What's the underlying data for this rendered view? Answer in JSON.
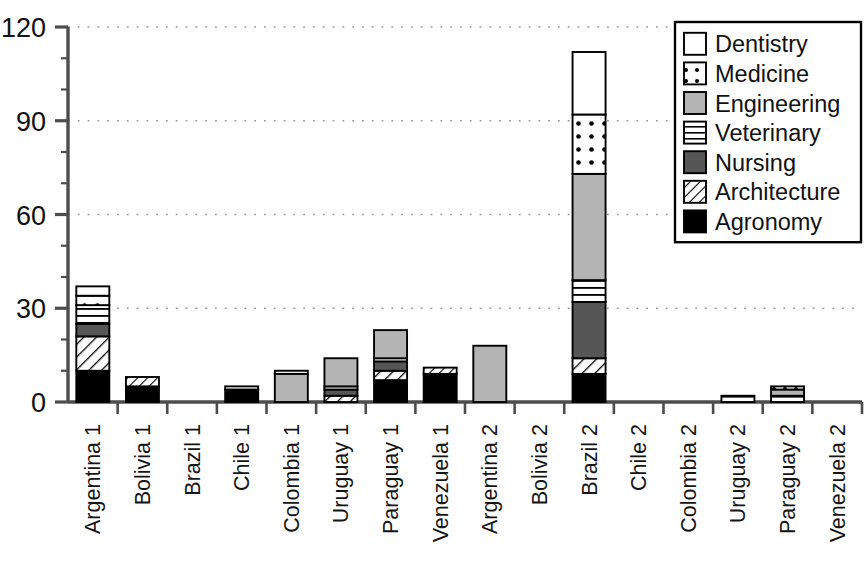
{
  "chart_data": {
    "type": "bar",
    "subtype": "stacked-vertical",
    "title": "",
    "subtitle": "",
    "xlabel": "",
    "ylabel": "",
    "ylim": [
      0,
      120
    ],
    "y_ticks": [
      0,
      30,
      60,
      90,
      120
    ],
    "y_tick_labels": [
      "0",
      "30",
      "60",
      "90",
      "120"
    ],
    "grid": "horizontal-dotted",
    "legend_position": "top-right",
    "categories": [
      "Argentina 1",
      "Bolivia 1",
      "Brazil 1",
      "Chile 1",
      "Colombia 1",
      "Uruguay 1",
      "Paraguay 1",
      "Venezuela 1",
      "Argentina 2",
      "Bolivia 2",
      "Brazil 2",
      "Chile 2",
      "Colombia 2",
      "Uruguay 2",
      "Paraguay 2",
      "Venezuela 2"
    ],
    "series": [
      {
        "name": "Agronomy",
        "pattern": "solid-black",
        "color": "#000000",
        "values": [
          10,
          5,
          0,
          4,
          0,
          0,
          7,
          9,
          0,
          0,
          9,
          0,
          0,
          0,
          0,
          0
        ]
      },
      {
        "name": "Architecture",
        "pattern": "diagonal-hatch",
        "color": "#ffffff",
        "values": [
          11,
          3,
          0,
          0,
          0,
          2,
          3,
          2,
          0,
          0,
          5,
          0,
          0,
          0,
          0,
          0
        ]
      },
      {
        "name": "Nursing",
        "pattern": "solid-dark-gray",
        "color": "#565656",
        "values": [
          4,
          0,
          0,
          0,
          0,
          2,
          3,
          0,
          0,
          0,
          18,
          0,
          0,
          0,
          0,
          0
        ]
      },
      {
        "name": "Veterinary",
        "pattern": "horizontal-lines",
        "color": "#ffffff",
        "values": [
          6,
          0,
          0,
          1,
          0,
          1,
          1,
          0,
          0,
          0,
          7,
          0,
          0,
          2,
          2,
          0
        ]
      },
      {
        "name": "Engineering",
        "pattern": "solid-light-gray",
        "color": "#b4b4b4",
        "values": [
          0,
          0,
          0,
          0,
          9,
          9,
          9,
          0,
          18,
          0,
          34,
          0,
          0,
          0,
          2,
          0
        ]
      },
      {
        "name": "Medicine",
        "pattern": "dotted",
        "color": "#ffffff",
        "values": [
          3,
          0,
          0,
          0,
          1,
          0,
          0,
          0,
          0,
          0,
          19,
          0,
          0,
          0,
          1,
          0
        ]
      },
      {
        "name": "Dentistry",
        "pattern": "white-outline",
        "color": "#ffffff",
        "values": [
          3,
          0,
          0,
          0,
          0,
          0,
          0,
          0,
          0,
          0,
          20,
          0,
          0,
          0,
          0,
          0
        ]
      }
    ],
    "totals": [
      37,
      8,
      0,
      5,
      10,
      14,
      23,
      11,
      18,
      0,
      112,
      0,
      0,
      2,
      5,
      0
    ],
    "legend_entries": [
      "Dentistry",
      "Medicine",
      "Engineering",
      "Veterinary",
      "Nursing",
      "Architecture",
      "Agronomy"
    ]
  },
  "colors": {
    "axis": "#4d4d4d",
    "grid": "#9a9a9a",
    "text": "#111111",
    "black": "#000000",
    "dark_gray": "#565656",
    "light_gray": "#b4b4b4",
    "white": "#ffffff"
  }
}
